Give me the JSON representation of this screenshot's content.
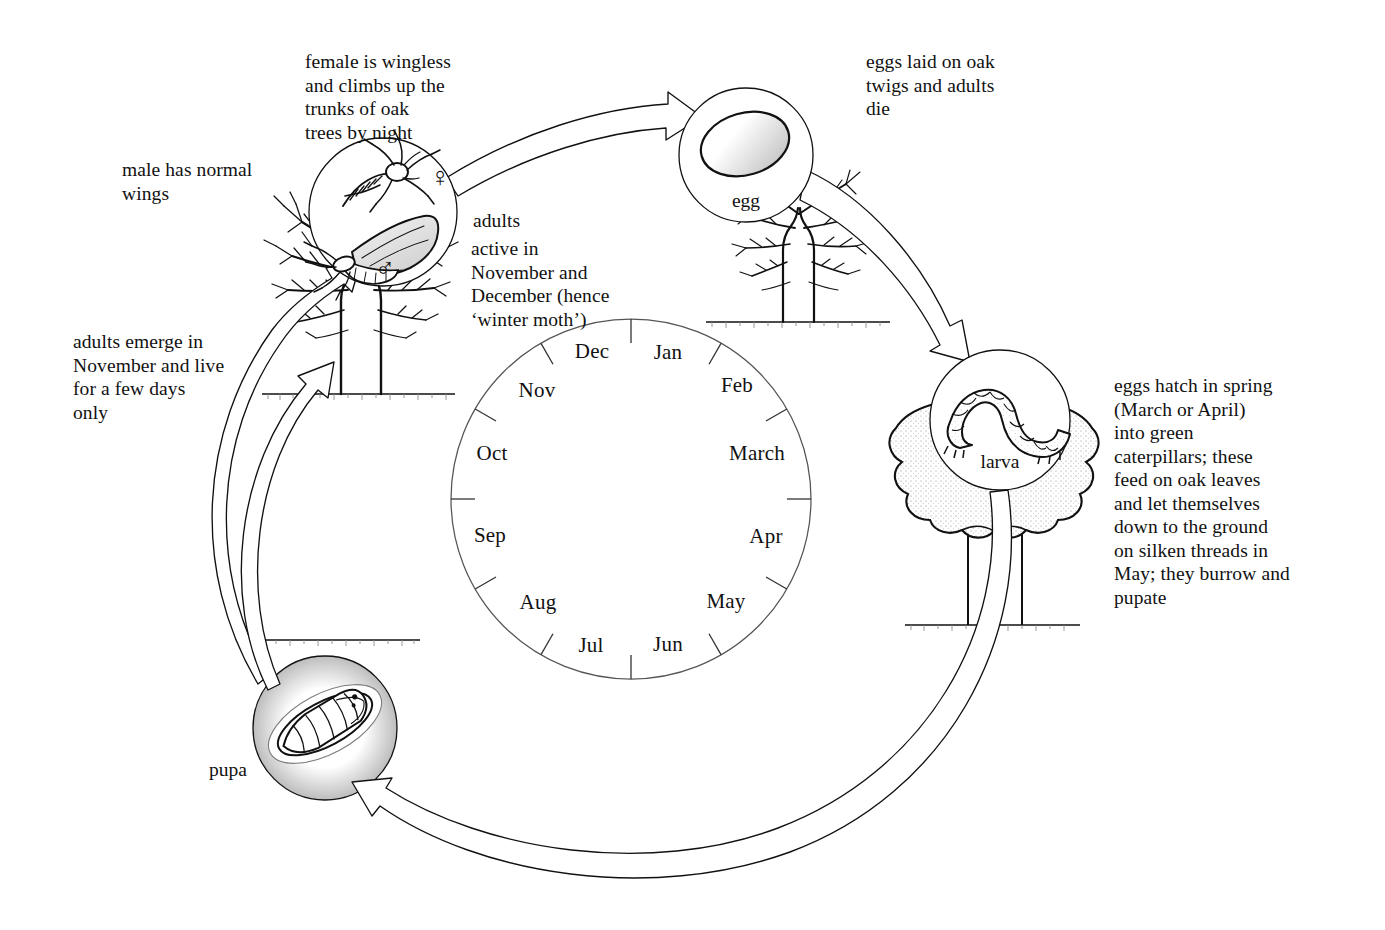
{
  "diagram": {
    "ink_color": "#111111",
    "background_color": "#ffffff"
  },
  "calendar": {
    "name": "month-wheel",
    "center": {
      "x": 631,
      "y": 499
    },
    "radius": 180,
    "direction": "clockwise",
    "months": [
      {
        "label": "Jan",
        "angle_deg": 15
      },
      {
        "label": "Feb",
        "angle_deg": 45
      },
      {
        "label": "March",
        "angle_deg": 75
      },
      {
        "label": "Apr",
        "angle_deg": 105
      },
      {
        "label": "May",
        "angle_deg": 135
      },
      {
        "label": "Jun",
        "angle_deg": 165
      },
      {
        "label": "Jul",
        "angle_deg": 195
      },
      {
        "label": "Aug",
        "angle_deg": 225
      },
      {
        "label": "Sep",
        "angle_deg": 255
      },
      {
        "label": "Oct",
        "angle_deg": 285
      },
      {
        "label": "Nov",
        "angle_deg": 315
      },
      {
        "label": "Dec",
        "angle_deg": 345
      }
    ]
  },
  "stages": [
    {
      "key": "adults",
      "label": "adults",
      "circle": {
        "x": 383,
        "y": 212,
        "r": 74
      },
      "symbols": [
        {
          "name": "female-symbol",
          "glyph": "♀",
          "x": 440,
          "y": 177
        },
        {
          "name": "male-symbol",
          "glyph": "♂",
          "x": 385,
          "y": 268
        }
      ]
    },
    {
      "key": "egg",
      "label": "egg",
      "circle": {
        "x": 746,
        "y": 155,
        "r": 67
      }
    },
    {
      "key": "larva",
      "label": "larva",
      "circle": {
        "x": 1000,
        "y": 420,
        "r": 70
      }
    },
    {
      "key": "pupa",
      "label": "pupa",
      "circle": {
        "x": 325,
        "y": 728,
        "r": 72
      }
    }
  ],
  "stage_label_positions": {
    "egg": {
      "x": 746,
      "y": 201
    },
    "larva": {
      "x": 1000,
      "y": 462
    },
    "pupa": {
      "x": 228,
      "y": 770
    }
  },
  "captions": [
    {
      "key": "female_wingless",
      "text": "female is wingless\nand climbs up the\ntrunks of oak\ntrees by night",
      "x": 305,
      "y": 50
    },
    {
      "key": "eggs_laid",
      "text": "eggs laid on oak\ntwigs and adults\ndie",
      "x": 866,
      "y": 50
    },
    {
      "key": "male_wings",
      "text": "male has  normal\nwings",
      "x": 122,
      "y": 158
    },
    {
      "key": "adults_heading",
      "text": "adults",
      "x": 473,
      "y": 209
    },
    {
      "key": "adults_active",
      "text": "active in\nNovember and\nDecember (hence\n‘winter moth’)",
      "x": 471,
      "y": 237
    },
    {
      "key": "adults_emerge",
      "text": "adults emerge in\nNovember and live\nfor a few days\nonly",
      "x": 73,
      "y": 330
    },
    {
      "key": "eggs_hatch",
      "text": "eggs hatch in spring\n(March or April)\ninto green\ncaterpillars; these\nfeed on oak leaves\nand let themselves\ndown to the ground\non silken threads in\nMay; they burrow and\npupate",
      "x": 1114,
      "y": 374
    }
  ],
  "arrows": [
    {
      "name": "arrow-adults-to-egg",
      "from": "adults",
      "to": "egg"
    },
    {
      "name": "arrow-egg-to-larva",
      "from": "egg",
      "to": "larva"
    },
    {
      "name": "arrow-larva-to-pupa",
      "from": "larva",
      "to": "pupa"
    },
    {
      "name": "arrow-pupa-to-adults",
      "from": "pupa",
      "to": "adults"
    }
  ],
  "trees": [
    {
      "name": "bare-oak-tree-winter",
      "season": "winter",
      "x": 360,
      "y": 300
    },
    {
      "name": "bare-oak-tree-egg",
      "season": "winter",
      "x": 800,
      "y": 230
    },
    {
      "name": "leafy-oak-tree-summer",
      "season": "summer",
      "x": 985,
      "y": 520
    }
  ]
}
